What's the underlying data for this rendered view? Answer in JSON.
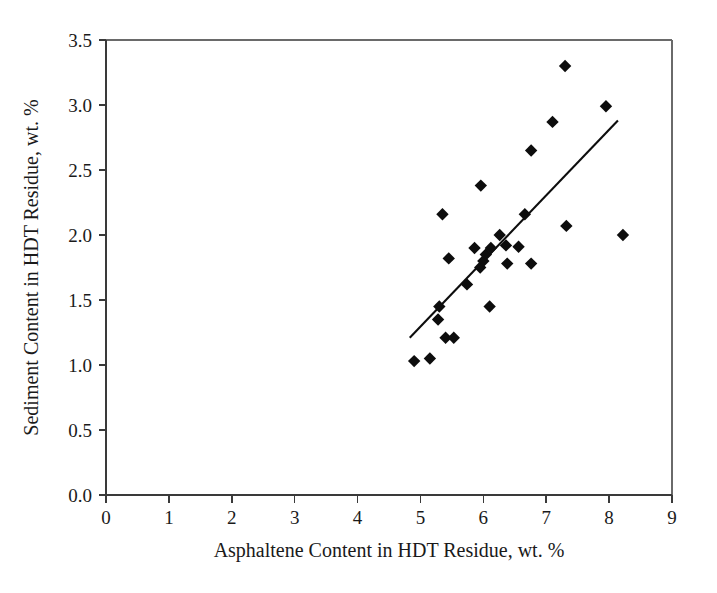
{
  "chart_data": {
    "type": "scatter",
    "title": "",
    "xlabel": "Asphaltene Content in HDT Residue, wt. %",
    "ylabel": "Sediment Content in HDT Residue, wt. %",
    "xlim": [
      0,
      9
    ],
    "ylim": [
      0.0,
      3.5
    ],
    "xticks": [
      "0",
      "1",
      "2",
      "3",
      "4",
      "5",
      "6",
      "7",
      "8",
      "9"
    ],
    "xtick_values": [
      0,
      1,
      2,
      3,
      4,
      5,
      6,
      7,
      8,
      9
    ],
    "yticks": [
      "0.0",
      "0.5",
      "1.0",
      "1.5",
      "2.0",
      "2.5",
      "3.0",
      "3.5"
    ],
    "ytick_values": [
      0.0,
      0.5,
      1.0,
      1.5,
      2.0,
      2.5,
      3.0,
      3.5
    ],
    "grid": false,
    "legend": false,
    "marker": "diamond",
    "marker_color": "#0d0d0d",
    "series": [
      {
        "name": "Sediment vs Asphaltene",
        "points": [
          [
            4.9,
            1.03
          ],
          [
            5.15,
            1.05
          ],
          [
            5.4,
            1.21
          ],
          [
            5.53,
            1.21
          ],
          [
            5.28,
            1.35
          ],
          [
            5.3,
            1.45
          ],
          [
            6.1,
            1.45
          ],
          [
            5.74,
            1.62
          ],
          [
            5.45,
            1.82
          ],
          [
            5.35,
            2.16
          ],
          [
            5.95,
            1.75
          ],
          [
            6.0,
            1.8
          ],
          [
            6.04,
            1.85
          ],
          [
            5.86,
            1.9
          ],
          [
            6.12,
            1.9
          ],
          [
            6.26,
            2.0
          ],
          [
            6.38,
            1.78
          ],
          [
            6.36,
            1.92
          ],
          [
            6.56,
            1.91
          ],
          [
            6.76,
            1.78
          ],
          [
            6.66,
            2.16
          ],
          [
            5.96,
            2.38
          ],
          [
            6.76,
            2.65
          ],
          [
            7.1,
            2.87
          ],
          [
            7.3,
            3.3
          ],
          [
            7.32,
            2.07
          ],
          [
            7.95,
            2.99
          ],
          [
            8.22,
            2.0
          ]
        ]
      }
    ],
    "trend_line": {
      "name": "linear fit",
      "x_start": 4.83,
      "y_start": 1.21,
      "x_end": 8.14,
      "y_end": 2.88,
      "color": "#0d0d0d"
    }
  },
  "axes": {
    "x_title": "Asphaltene Content in HDT Residue, wt. %",
    "y_title": "Sediment Content in HDT Residue, wt. %"
  }
}
